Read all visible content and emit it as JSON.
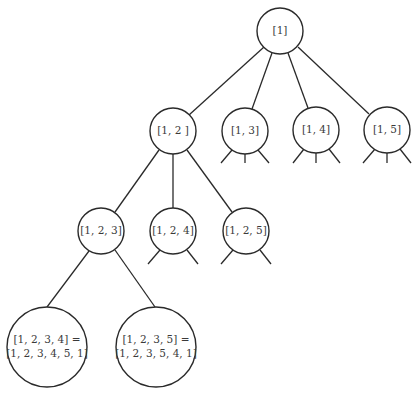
{
  "diagram": {
    "type": "tree",
    "nodes": [
      {
        "id": "n1",
        "label": "[1]",
        "x": 280,
        "y": 31,
        "r": 23
      },
      {
        "id": "n12",
        "label": "[1, 2 ]",
        "x": 173,
        "y": 131,
        "r": 23
      },
      {
        "id": "n13",
        "label": "[1, 3]",
        "x": 244,
        "y": 131,
        "r": 23
      },
      {
        "id": "n14",
        "label": "[1, 4]",
        "x": 316,
        "y": 130,
        "r": 23
      },
      {
        "id": "n15",
        "label": "[1, 5]",
        "x": 387,
        "y": 130,
        "r": 23
      },
      {
        "id": "n123",
        "label": "[1, 2, 3]",
        "x": 101,
        "y": 231,
        "r": 23
      },
      {
        "id": "n124",
        "label": "[1, 2, 4]",
        "x": 173,
        "y": 231,
        "r": 23
      },
      {
        "id": "n125",
        "label": "[1, 2, 5]",
        "x": 246,
        "y": 231,
        "r": 23
      },
      {
        "id": "n1234",
        "label_line1": "[1, 2, 3, 4] =",
        "label_line2": "[1, 2, 3, 4, 5, 1]",
        "x": 47,
        "y": 347,
        "r": 40
      },
      {
        "id": "n1235",
        "label_line1": "[1, 2, 3, 5] =",
        "label_line2": "[1, 2, 3, 5, 4, 1]",
        "x": 156,
        "y": 347,
        "r": 40
      }
    ],
    "edges": [
      [
        "n1",
        "n12"
      ],
      [
        "n1",
        "n13"
      ],
      [
        "n1",
        "n14"
      ],
      [
        "n1",
        "n15"
      ],
      [
        "n12",
        "n123"
      ],
      [
        "n12",
        "n124"
      ],
      [
        "n12",
        "n125"
      ],
      [
        "n123",
        "n1234"
      ],
      [
        "n123",
        "n1235"
      ]
    ],
    "stubs": {
      "n13": 3,
      "n14": 3,
      "n15": 3,
      "n124": 2,
      "n125": 2
    }
  }
}
